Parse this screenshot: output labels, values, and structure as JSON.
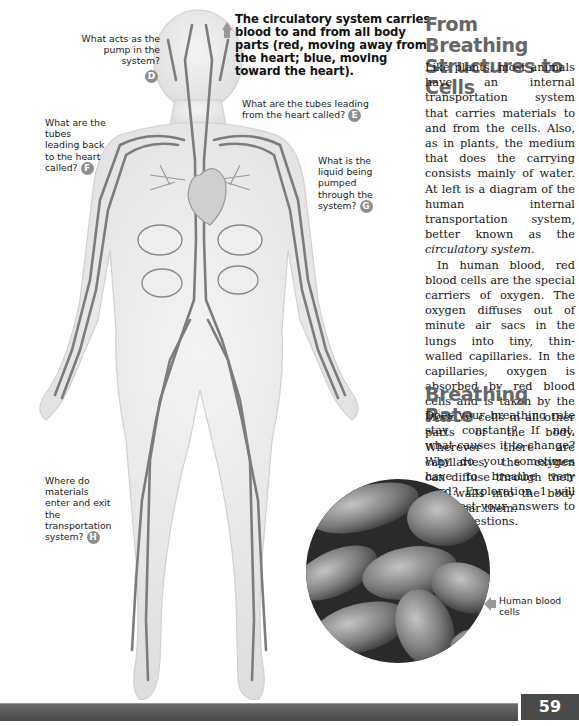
{
  "diagram": {
    "main_caption": "The circulatory system carries blood to and from all body parts (red, moving away from the heart; blue, moving toward the heart).",
    "questions": [
      {
        "id": "D",
        "text": "What acts as the pump in the system?"
      },
      {
        "id": "E",
        "text": "What are the tubes leading from the heart called?"
      },
      {
        "id": "F",
        "text": "What are the tubes leading back to the heart called?"
      },
      {
        "id": "G",
        "text": "What is the liquid being pumped through the system?"
      },
      {
        "id": "H",
        "text": "Where do materials enter and exit the transportation system?"
      }
    ],
    "figure_label": "human circulatory system illustration"
  },
  "section1": {
    "heading": "From Breathing Structures to Cells",
    "p1_before": "Like plants, most animals have an internal transportation system that carries materials to and from the cells. Also, as in plants, the medium that does the carrying consists mainly of water. At left is a diagram of the human internal transportation system, better known as the ",
    "p1_italic": "circulatory system",
    "p1_after": ".",
    "p2": "In human blood, red blood cells are the special carriers of oxygen. The oxygen diffuses out of minute air sacs in the lungs into tiny, thin-walled capillaries. In the capillaries, oxygen is absorbed by red blood cells and is taken by the blood to cells in all other parts of the body. Wherever there are capillaries, the oxygen can diffuse through their thin walls into the body cells near them."
  },
  "section2": {
    "heading": "Breathing Rate",
    "p1": "Does your breathing rate stay constant? If not, what causes it to change? Why do you sometimes have to breathe very hard? Exploration 1 will help test your answers to these questions."
  },
  "photo": {
    "caption": "Human blood cells"
  },
  "footer": {
    "page_number": "59"
  }
}
